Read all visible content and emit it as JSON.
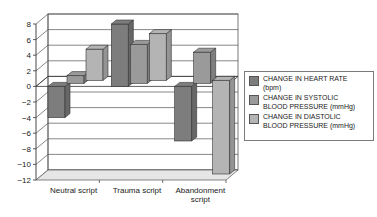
{
  "chart_data": {
    "type": "bar",
    "style": "3d-clustered-column",
    "title": "",
    "xlabel": "",
    "ylabel": "",
    "categories": [
      "Neutral script",
      "Trauma script",
      "Abandonment script"
    ],
    "category_labels": [
      [
        "Neutral script"
      ],
      [
        "Trauma script"
      ],
      [
        "Abandonment",
        "script"
      ]
    ],
    "series": [
      {
        "name": "CHANGE IN HEART RATE (bpm)",
        "label_lines": [
          "CHANGE IN HEART RATE",
          "(bpm)"
        ],
        "color": "#7d7d7d",
        "values": [
          -4,
          8,
          -7
        ]
      },
      {
        "name": "CHANGE IN SYSTOLIC BLOOD PRESSURE (mmHg)",
        "label_lines": [
          "CHANGE IN SYSTOLIC",
          "BLOOD PRESSURE (mmHg)"
        ],
        "color": "#9a9a9a",
        "values": [
          1,
          5,
          4
        ]
      },
      {
        "name": "CHANGE IN DIASTOLIC BLOOD PRESSURE (mmHg)",
        "label_lines": [
          "CHANGE IN DIASTOLIC",
          "BLOOD PRESSURE (mmHg)"
        ],
        "color": "#b4b4b4",
        "values": [
          4,
          6,
          -12
        ]
      }
    ],
    "ylim": [
      -12,
      8
    ],
    "yticks": [
      8,
      6,
      4,
      2,
      0,
      -2,
      -4,
      -6,
      -8,
      -10,
      -12
    ],
    "ytick_labels": [
      "8",
      "6",
      "4",
      "2",
      "0",
      "−2",
      "−4",
      "−6",
      "−8",
      "−10",
      "−12"
    ],
    "grid": true,
    "legend_position": "right"
  }
}
